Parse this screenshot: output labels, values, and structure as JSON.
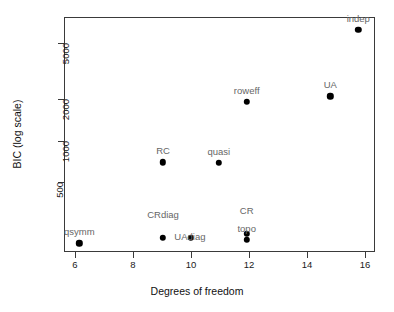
{
  "chart_data": {
    "type": "scatter",
    "title": "",
    "xlabel": "Degrees of freedom",
    "ylabel": "BIC (log scale)",
    "xlim": [
      5.45,
      16.6
    ],
    "ylim": [
      270,
      7300
    ],
    "yscale": "log",
    "xscale": "linear",
    "grid": false,
    "legend": "none",
    "xticks": [
      6,
      8,
      10,
      12,
      14,
      16
    ],
    "xticklabels": [
      "6",
      "8",
      "10",
      "12",
      "14",
      "16"
    ],
    "yticks": [
      500,
      1000,
      2000,
      5000
    ],
    "yticklabels": [
      "500",
      "1000",
      "2000",
      "5000"
    ],
    "point_marker": "filled-circle",
    "point_color": "#000000",
    "label_color": "#666666",
    "frame_color": "#3a3a3a",
    "points": [
      {
        "label": "qsymm",
        "x": 6,
        "y": 305,
        "label_pos": "above"
      },
      {
        "label": "CRdiag",
        "x": 9,
        "y": 330,
        "label_pos": "above-far"
      },
      {
        "label": "RC",
        "x": 9,
        "y": 950,
        "label_pos": "above"
      },
      {
        "label": "UAdiag",
        "x": 10,
        "y": 330,
        "label_pos": "right-overlap"
      },
      {
        "label": "quasi",
        "x": 11,
        "y": 945,
        "label_pos": "above"
      },
      {
        "label": "CR",
        "x": 12,
        "y": 350,
        "label_pos": "above-far"
      },
      {
        "label": "topo",
        "x": 12,
        "y": 320,
        "label_pos": "above"
      },
      {
        "label": "roweff",
        "x": 12,
        "y": 2230,
        "label_pos": "above"
      },
      {
        "label": "UA",
        "x": 15,
        "y": 2400,
        "label_pos": "above"
      },
      {
        "label": "indep",
        "x": 16,
        "y": 6100,
        "label_pos": "above-clipped"
      }
    ]
  }
}
